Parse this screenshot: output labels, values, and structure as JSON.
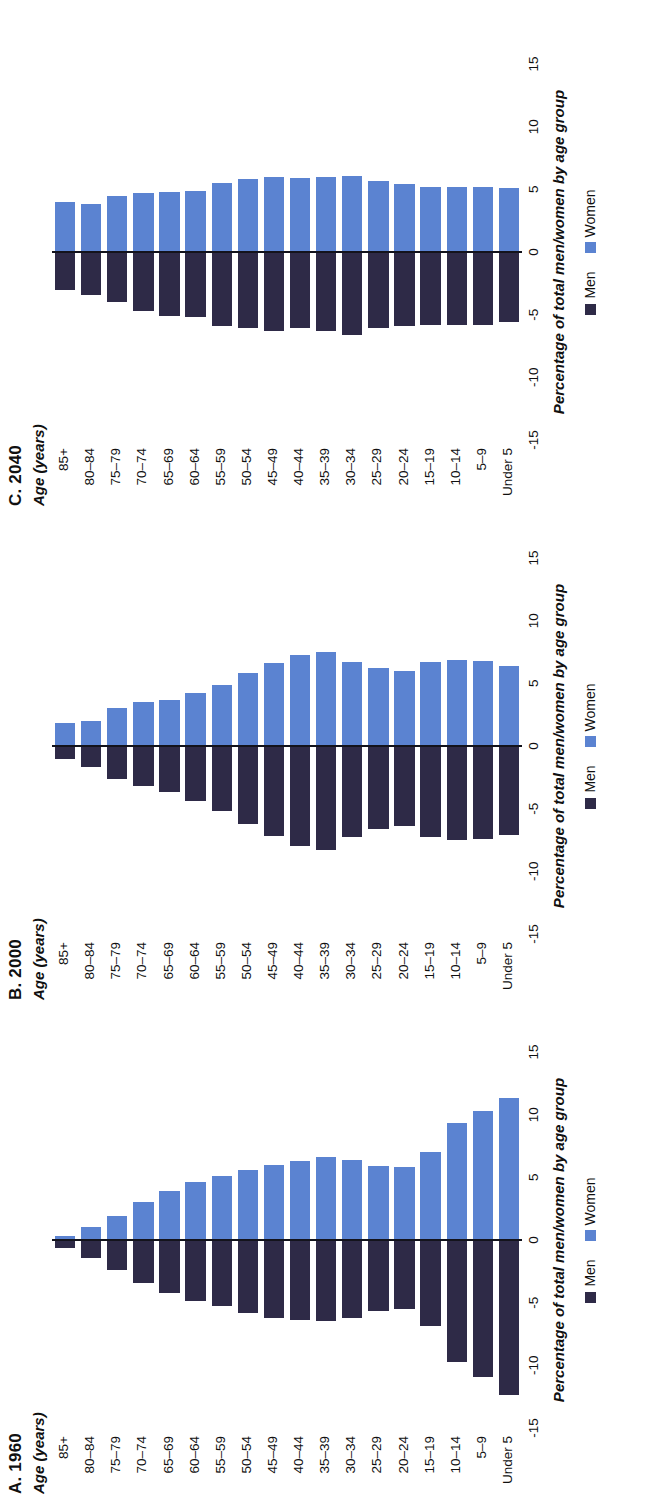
{
  "colors": {
    "men": "#2e2a47",
    "women": "#5b83d1",
    "axis": "#13131c",
    "background": "#ffffff"
  },
  "legend": {
    "men_label": "Men",
    "women_label": "Women"
  },
  "axis": {
    "category_axis_title": "Age (years)",
    "value_axis_title": "Percentage of total men/women by age group",
    "ticks": [
      "-15",
      "-10",
      "-5",
      "0",
      "5",
      "10",
      "15"
    ],
    "tick_values": [
      -15,
      -10,
      -5,
      0,
      5,
      10,
      15
    ],
    "range": [
      -15,
      15
    ]
  },
  "categories": [
    "85+",
    "80–84",
    "75–79",
    "70–74",
    "65–69",
    "60–64",
    "55–59",
    "50–54",
    "45–49",
    "40–44",
    "35–39",
    "30–34",
    "25–29",
    "20–24",
    "15–19",
    "10–14",
    "5–9",
    "Under 5"
  ],
  "panels": [
    {
      "id": "a",
      "title": "A. 1960"
    },
    {
      "id": "b",
      "title": "B. 2000"
    },
    {
      "id": "c",
      "title": "C. 2040"
    }
  ],
  "chart_data": [
    {
      "type": "bar",
      "title": "A. 1960",
      "orientation": "horizontal-diverging",
      "xlabel": "Percentage of total men/women by age group",
      "ylabel": "Age (years)",
      "xlim": [
        -15,
        15
      ],
      "grid": false,
      "legend_position": "bottom-center",
      "categories": [
        "85+",
        "80–84",
        "75–79",
        "70–74",
        "65–69",
        "60–64",
        "55–59",
        "50–54",
        "45–49",
        "40–44",
        "35–39",
        "30–34",
        "25–29",
        "20–24",
        "15–19",
        "10–14",
        "5–9",
        "Under 5"
      ],
      "series": [
        {
          "name": "Men",
          "values": [
            -0.6,
            -1.4,
            -2.4,
            -3.4,
            -4.2,
            -4.9,
            -5.3,
            -5.8,
            -6.2,
            -6.4,
            -6.5,
            -6.2,
            -5.7,
            -5.5,
            -6.9,
            -9.7,
            -10.9,
            -12.4
          ]
        },
        {
          "name": "Women",
          "values": [
            0.3,
            1.0,
            1.9,
            3.0,
            3.9,
            4.6,
            5.1,
            5.6,
            6.0,
            6.3,
            6.6,
            6.4,
            5.9,
            5.8,
            7.0,
            9.3,
            10.3,
            11.3
          ]
        }
      ]
    },
    {
      "type": "bar",
      "title": "B. 2000",
      "orientation": "horizontal-diverging",
      "xlabel": "Percentage of total men/women by age group",
      "ylabel": "Age (years)",
      "xlim": [
        -15,
        15
      ],
      "grid": false,
      "legend_position": "bottom-center",
      "categories": [
        "85+",
        "80–84",
        "75–79",
        "70–74",
        "65–69",
        "60–64",
        "55–59",
        "50–54",
        "45–49",
        "40–44",
        "35–39",
        "30–34",
        "25–29",
        "20–24",
        "15–19",
        "10–14",
        "5–9",
        "Under 5"
      ],
      "series": [
        {
          "name": "Men",
          "values": [
            -1.0,
            -1.7,
            -2.6,
            -3.2,
            -3.7,
            -4.4,
            -5.2,
            -6.2,
            -7.2,
            -8.0,
            -8.3,
            -7.3,
            -6.6,
            -6.4,
            -7.3,
            -7.5,
            -7.4,
            -7.1
          ]
        },
        {
          "name": "Women",
          "values": [
            1.8,
            2.0,
            3.0,
            3.5,
            3.7,
            4.2,
            4.9,
            5.8,
            6.6,
            7.3,
            7.5,
            6.7,
            6.2,
            6.0,
            6.7,
            6.9,
            6.8,
            6.4
          ]
        }
      ]
    },
    {
      "type": "bar",
      "title": "C. 2040",
      "orientation": "horizontal-diverging",
      "xlabel": "Percentage of total men/women by age group",
      "ylabel": "Age (years)",
      "xlim": [
        -15,
        15
      ],
      "grid": false,
      "legend_position": "bottom-center",
      "categories": [
        "85+",
        "80–84",
        "75–79",
        "70–74",
        "65–69",
        "60–64",
        "55–59",
        "50–54",
        "45–49",
        "40–44",
        "35–39",
        "30–34",
        "25–29",
        "20–24",
        "15–19",
        "10–14",
        "5–9",
        "Under 5"
      ],
      "series": [
        {
          "name": "Men",
          "values": [
            -3.0,
            -3.4,
            -4.0,
            -4.7,
            -5.1,
            -5.2,
            -5.9,
            -6.1,
            -6.3,
            -6.1,
            -6.3,
            -6.6,
            -6.1,
            -5.9,
            -5.8,
            -5.8,
            -5.8,
            -5.6
          ]
        },
        {
          "name": "Women",
          "values": [
            4.0,
            3.8,
            4.5,
            4.7,
            4.8,
            4.9,
            5.5,
            5.8,
            6.0,
            5.9,
            6.0,
            6.1,
            5.7,
            5.4,
            5.2,
            5.2,
            5.2,
            5.1
          ]
        }
      ]
    }
  ]
}
